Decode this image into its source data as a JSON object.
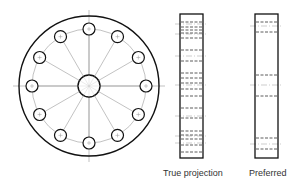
{
  "figure": {
    "front_view": {
      "name": "flange-front-view",
      "outer_radius": 70,
      "pcd_radius": 57,
      "hole_radius": 6,
      "hole_count": 12,
      "center_bore_radius": 11,
      "center": [
        89,
        86
      ]
    },
    "side_views": [
      {
        "label": "True projection",
        "x": 180,
        "y": 14,
        "width": 23,
        "height": 144,
        "hidden_lines": [
          22,
          27,
          30,
          33,
          38,
          50,
          61,
          73,
          78,
          83,
          89,
          96,
          108,
          118,
          131,
          135,
          139,
          145,
          152
        ],
        "center_lines": [
          24,
          34,
          56,
          85,
          116,
          136,
          143
        ]
      },
      {
        "label": "Preferred",
        "x": 255,
        "y": 14,
        "width": 23,
        "height": 144,
        "hidden_lines": [
          22,
          32,
          75,
          96,
          138,
          149
        ],
        "center_lines": [
          26,
          85,
          144
        ]
      }
    ]
  },
  "colors": {
    "line": "#111111",
    "thin": "#999999"
  }
}
